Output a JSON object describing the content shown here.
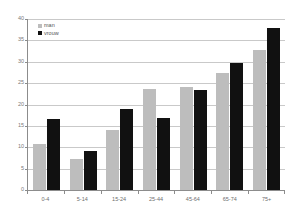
{
  "chart_data": {
    "type": "bar",
    "title": "",
    "subtitle": "",
    "xlabel": "",
    "ylabel": "",
    "ylim": [
      0,
      40
    ],
    "ytick_step": 5,
    "yticks": [
      "0",
      "5",
      "10",
      "15",
      "20",
      "25",
      "30",
      "35",
      "40"
    ],
    "grid": true,
    "legend_position": "top-left",
    "categories": [
      "0-4",
      "5-14",
      "15-24",
      "25-44",
      "45-64",
      "65-74",
      "75+"
    ],
    "series": [
      {
        "name": "man",
        "color": "#bdbdbd",
        "values": [
          10.7,
          7.2,
          14.1,
          23.7,
          24.2,
          27.4,
          32.7
        ]
      },
      {
        "name": "vrouw",
        "color": "#111111",
        "values": [
          16.5,
          9.1,
          19.0,
          16.8,
          23.3,
          29.8,
          38.0
        ]
      }
    ]
  },
  "axis": {
    "line_color": "#8c8c8c",
    "grid_color": "#c9c9c9",
    "tick_label_color": "#7a7a7a"
  },
  "legend": {
    "items": [
      {
        "label": "man",
        "swatch": "legend-swatch-man"
      },
      {
        "label": "vrouw",
        "swatch": "legend-swatch-vrouw"
      }
    ]
  }
}
